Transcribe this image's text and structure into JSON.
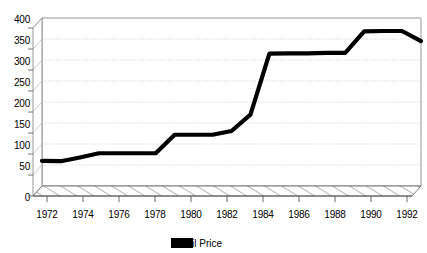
{
  "chart_data": {
    "type": "line",
    "title": "",
    "subtitle": "",
    "xlabel": "",
    "ylabel": "",
    "grid": true,
    "style": "3d-perspective-line",
    "legend_position": "bottom-center",
    "xlim": [
      1972,
      1992
    ],
    "ylim": [
      0,
      400
    ],
    "ytick_labels": [
      "0",
      "50",
      "100",
      "150",
      "200",
      "250",
      "300",
      "350",
      "400"
    ],
    "yticks": [
      0,
      50,
      100,
      150,
      200,
      250,
      300,
      350,
      400
    ],
    "xtick_labels": [
      "1972",
      "1974",
      "1976",
      "1978",
      "1980",
      "1982",
      "1984",
      "1986",
      "1988",
      "1990",
      "1992"
    ],
    "xticks": [
      1972,
      1974,
      1976,
      1978,
      1980,
      1982,
      1984,
      1986,
      1988,
      1990,
      1992
    ],
    "series": [
      {
        "name": "Retail Price",
        "color": "#000000",
        "x": [
          1972,
          1973,
          1974,
          1975,
          1976,
          1977,
          1978,
          1979,
          1980,
          1981,
          1982,
          1983,
          1984,
          1985,
          1986,
          1987,
          1988,
          1989,
          1990,
          1991,
          1992
        ],
        "values": [
          60,
          59,
          68,
          78,
          78,
          78,
          78,
          122,
          122,
          122,
          131,
          170,
          315,
          316,
          316,
          317,
          317,
          368,
          369,
          369,
          345
        ]
      }
    ]
  },
  "legend": {
    "items": [
      {
        "label": "Retail Price",
        "swatch_color": "#000000"
      }
    ]
  },
  "axes": {
    "y": {
      "ticks": [
        "400",
        "350",
        "300",
        "250",
        "200",
        "150",
        "100",
        "50",
        "0"
      ]
    },
    "x": {
      "ticks": [
        "1972",
        "1974",
        "1976",
        "1978",
        "1980",
        "1982",
        "1984",
        "1986",
        "1988",
        "1990",
        "1992"
      ]
    }
  },
  "colors": {
    "line": "#000000",
    "grid": "#c8c8c8",
    "axis": "#7a7a7a",
    "background": "#ffffff"
  }
}
